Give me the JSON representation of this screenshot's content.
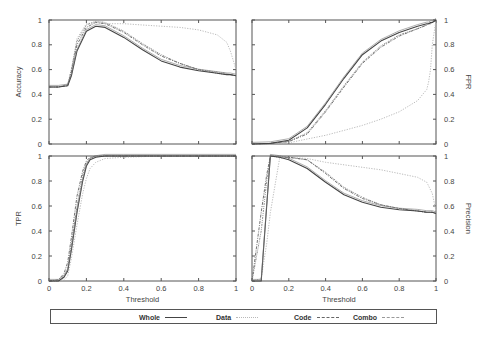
{
  "figure": {
    "x_axis_label": "Threshold",
    "x_ticks": [
      "0",
      "0.2",
      "0.4",
      "0.6",
      "0.8",
      "1"
    ],
    "y_ticks": [
      "0",
      "0.2",
      "0.4",
      "0.6",
      "0.8",
      "1"
    ]
  },
  "legend": {
    "items": [
      {
        "label": "Whole",
        "style": "solid",
        "color": "#444444"
      },
      {
        "label": "Data",
        "style": "dotted",
        "color": "#b8b8b8"
      },
      {
        "label": "Code",
        "style": "dash-dot",
        "color": "#666666"
      },
      {
        "label": "Combo",
        "style": "dash-dot-dot",
        "color": "#888888"
      }
    ]
  },
  "chart_data": [
    {
      "type": "line",
      "title": "",
      "panel": "top-left",
      "xlabel": "",
      "ylabel": "Accuracy",
      "ylabel_side": "left",
      "xlim": [
        0,
        1
      ],
      "ylim": [
        0,
        1
      ],
      "x": [
        0,
        0.05,
        0.1,
        0.12,
        0.15,
        0.2,
        0.25,
        0.3,
        0.4,
        0.5,
        0.6,
        0.7,
        0.8,
        0.9,
        0.95,
        0.97,
        1.0
      ],
      "series": [
        {
          "name": "Whole",
          "values": [
            0.46,
            0.46,
            0.47,
            0.55,
            0.75,
            0.91,
            0.95,
            0.94,
            0.86,
            0.76,
            0.67,
            0.62,
            0.59,
            0.57,
            0.56,
            0.56,
            0.55
          ]
        },
        {
          "name": "Data",
          "values": [
            0.46,
            0.46,
            0.48,
            0.6,
            0.85,
            0.97,
            0.98,
            0.97,
            0.97,
            0.96,
            0.95,
            0.94,
            0.92,
            0.88,
            0.82,
            0.75,
            0.6
          ]
        },
        {
          "name": "Code",
          "values": [
            0.46,
            0.46,
            0.47,
            0.58,
            0.8,
            0.94,
            0.98,
            0.97,
            0.9,
            0.8,
            0.71,
            0.65,
            0.6,
            0.57,
            0.56,
            0.56,
            0.55
          ]
        },
        {
          "name": "Combo",
          "values": [
            0.46,
            0.46,
            0.48,
            0.6,
            0.83,
            0.96,
            0.99,
            0.98,
            0.91,
            0.81,
            0.72,
            0.65,
            0.6,
            0.58,
            0.57,
            0.56,
            0.55
          ]
        }
      ]
    },
    {
      "type": "line",
      "title": "",
      "panel": "top-right",
      "xlabel": "",
      "ylabel": "FPR",
      "ylabel_side": "right",
      "xlim": [
        0,
        1
      ],
      "ylim": [
        0,
        1
      ],
      "x": [
        0,
        0.1,
        0.2,
        0.3,
        0.4,
        0.5,
        0.6,
        0.7,
        0.8,
        0.9,
        0.95,
        0.96,
        0.97,
        0.98,
        1.0
      ],
      "series": [
        {
          "name": "Whole",
          "values": [
            0,
            0.005,
            0.03,
            0.13,
            0.32,
            0.53,
            0.72,
            0.83,
            0.9,
            0.95,
            0.97,
            0.97,
            0.98,
            0.98,
            1.0
          ]
        },
        {
          "name": "Data",
          "values": [
            0,
            0.003,
            0.01,
            0.04,
            0.07,
            0.11,
            0.15,
            0.2,
            0.26,
            0.35,
            0.44,
            0.5,
            0.6,
            0.8,
            1.0
          ]
        },
        {
          "name": "Code",
          "values": [
            0,
            0.005,
            0.02,
            0.08,
            0.26,
            0.46,
            0.65,
            0.78,
            0.87,
            0.93,
            0.96,
            0.97,
            0.97,
            0.98,
            1.0
          ]
        },
        {
          "name": "Combo",
          "values": [
            0,
            0.005,
            0.02,
            0.09,
            0.27,
            0.47,
            0.66,
            0.79,
            0.88,
            0.93,
            0.96,
            0.97,
            0.97,
            0.98,
            1.0
          ]
        }
      ]
    },
    {
      "type": "line",
      "title": "",
      "panel": "bottom-left",
      "xlabel": "Threshold",
      "ylabel": "TPR",
      "ylabel_side": "left",
      "xlim": [
        0,
        1
      ],
      "ylim": [
        0,
        1
      ],
      "x": [
        0,
        0.05,
        0.08,
        0.1,
        0.12,
        0.15,
        0.18,
        0.2,
        0.22,
        0.25,
        0.3,
        0.4,
        0.6,
        0.8,
        1.0
      ],
      "series": [
        {
          "name": "Whole",
          "values": [
            0,
            0,
            0.03,
            0.08,
            0.25,
            0.55,
            0.8,
            0.92,
            0.97,
            0.99,
            1.0,
            1.0,
            1.0,
            1.0,
            1.0
          ]
        },
        {
          "name": "Data",
          "values": [
            0,
            0,
            0.01,
            0.04,
            0.18,
            0.45,
            0.7,
            0.82,
            0.9,
            0.95,
            0.98,
            0.99,
            1.0,
            1.0,
            1.0
          ]
        },
        {
          "name": "Code",
          "values": [
            0,
            0.01,
            0.06,
            0.15,
            0.35,
            0.68,
            0.88,
            0.96,
            0.99,
            1.0,
            1.0,
            1.0,
            1.0,
            1.0,
            1.0
          ]
        },
        {
          "name": "Combo",
          "values": [
            0,
            0,
            0.04,
            0.1,
            0.3,
            0.6,
            0.85,
            0.94,
            0.98,
            1.0,
            1.0,
            1.0,
            1.0,
            1.0,
            1.0
          ]
        }
      ]
    },
    {
      "type": "line",
      "title": "",
      "panel": "bottom-right",
      "xlabel": "Threshold",
      "ylabel": "Precision",
      "ylabel_side": "right",
      "xlim": [
        0,
        1
      ],
      "ylim": [
        0,
        1
      ],
      "x": [
        0,
        0.05,
        0.08,
        0.1,
        0.15,
        0.2,
        0.3,
        0.4,
        0.5,
        0.6,
        0.7,
        0.8,
        0.9,
        0.95,
        0.98,
        1.0
      ],
      "series": [
        {
          "name": "Whole",
          "values": [
            0,
            0,
            0.6,
            1.0,
            0.99,
            0.97,
            0.9,
            0.79,
            0.69,
            0.63,
            0.59,
            0.57,
            0.56,
            0.55,
            0.55,
            0.54
          ]
        },
        {
          "name": "Data",
          "values": [
            0,
            0.02,
            0.3,
            0.55,
            0.98,
            0.99,
            0.98,
            0.95,
            0.93,
            0.91,
            0.89,
            0.86,
            0.83,
            0.79,
            0.7,
            0.56
          ]
        },
        {
          "name": "Code",
          "values": [
            0,
            0.55,
            0.85,
            1.0,
            0.99,
            0.99,
            0.97,
            0.86,
            0.74,
            0.66,
            0.61,
            0.58,
            0.56,
            0.55,
            0.55,
            0.54
          ]
        },
        {
          "name": "Combo",
          "values": [
            0,
            0.4,
            0.8,
            1.0,
            1.0,
            0.99,
            0.97,
            0.87,
            0.75,
            0.67,
            0.61,
            0.58,
            0.56,
            0.55,
            0.55,
            0.54
          ]
        }
      ]
    }
  ]
}
